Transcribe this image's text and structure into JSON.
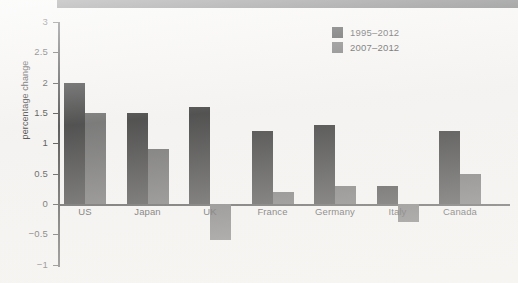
{
  "header": {
    "band_color": "#4b4b4b",
    "title": ""
  },
  "legend": {
    "position": "top-right",
    "entries": [
      {
        "label": "1995–2012",
        "color": "#2b2b2b",
        "swatch": "legend-swatch-dark"
      },
      {
        "label": "2007–2012",
        "color": "#5e5e5e",
        "swatch": "legend-swatch-gray"
      }
    ]
  },
  "chart_data": {
    "type": "bar",
    "title": "",
    "subtitle": "",
    "xlabel": "",
    "ylabel": "percentage change",
    "categories": [
      "US",
      "Japan",
      "UK",
      "France",
      "Germany",
      "Italy",
      "Canada"
    ],
    "series": [
      {
        "name": "1995–2012",
        "color": "#2b2b2b",
        "values": [
          2.0,
          1.5,
          1.6,
          1.2,
          1.3,
          0.3,
          1.2
        ]
      },
      {
        "name": "2007–2012",
        "color": "#5e5e5e",
        "values": [
          1.5,
          0.9,
          -0.6,
          0.2,
          0.3,
          -0.3,
          0.5
        ]
      }
    ],
    "ylim": [
      -1,
      3
    ],
    "yticks": [
      3,
      2.5,
      2,
      1.5,
      1,
      0.5,
      0,
      -0.5,
      -1
    ],
    "ytick_labels": [
      "3",
      "2.5",
      "2",
      "1.5",
      "1",
      "0.5",
      "0",
      "−0.5",
      "−1"
    ],
    "grid": false,
    "zero_line": true,
    "legend_position": "top-right"
  }
}
